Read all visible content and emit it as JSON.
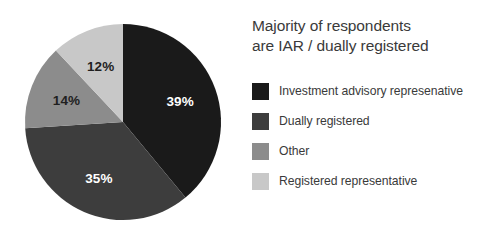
{
  "chart_data": {
    "type": "pie",
    "title": "Majority of respondents are IAR / dually registered",
    "title_lines": [
      "Majority of respondents",
      "are IAR / dually registered"
    ],
    "categories": [
      "Investment advisory represenative",
      "Dually registered",
      "Other",
      "Registered representative"
    ],
    "values": [
      39,
      35,
      14,
      12
    ],
    "value_labels": [
      "39%",
      "35%",
      "14%",
      "12%"
    ],
    "colors": [
      "#1a1a1a",
      "#3d3d3d",
      "#8c8c8c",
      "#c8c8c8"
    ],
    "label_colors": [
      "#ffffff",
      "#ffffff",
      "#1f1f1f",
      "#1f1f1f"
    ],
    "units": "percent",
    "start_angle_deg": 0,
    "direction": "clockwise",
    "legend_position": "right",
    "grid": false,
    "xlabel": "",
    "ylabel": ""
  },
  "legend": {
    "items": [
      {
        "label": "Investment advisory represenative",
        "color": "#1a1a1a",
        "value_label": "39%"
      },
      {
        "label": "Dually registered",
        "color": "#3d3d3d",
        "value_label": "35%"
      },
      {
        "label": "Other",
        "color": "#8c8c8c",
        "value_label": "14%"
      },
      {
        "label": "Registered representative",
        "color": "#c8c8c8",
        "value_label": "12%"
      }
    ]
  },
  "pie_geometry": {
    "center_x": 123,
    "center_y": 122,
    "radius": 98,
    "label_radius_factor": 0.62
  }
}
